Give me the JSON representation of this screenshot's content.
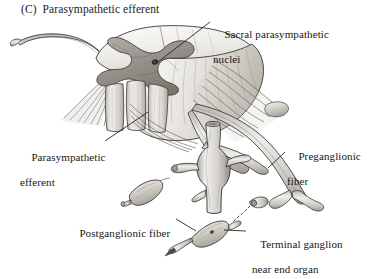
{
  "figure": {
    "panel_letter": "(C)",
    "title": "(C)  Parasympathetic efferent",
    "background_color": "#ffffff",
    "ink_color": "#161616",
    "style": "grayscale anatomical line-and-wash illustration"
  },
  "labels": {
    "sacral_nuclei": {
      "line1": "Sacral parasympathetic",
      "line2": "nuclei"
    },
    "parasympathetic_efferent": {
      "line1": "Parasympathetic",
      "line2": "efferent"
    },
    "preganglionic_fiber": {
      "line1": "Preganglionic",
      "line2": "fiber"
    },
    "postganglionic_fiber": {
      "line1": "Postganglionic fiber"
    },
    "terminal_ganglion": {
      "line1": "Terminal ganglion",
      "line2": "near end organ"
    }
  },
  "structures": [
    {
      "name": "spinal-cord-segment",
      "description": "cut sacral spinal cord block with butterfly gray matter"
    },
    {
      "name": "gray-matter-butterfly",
      "description": "H-shaped gray matter on cut face"
    },
    {
      "name": "white-matter-columns",
      "description": "pale longitudinal columns"
    },
    {
      "name": "dorsal-root-fibers",
      "description": "fanned rootlets left and right"
    },
    {
      "name": "spinal-nerve-trunk-left",
      "description": "curved nerve trunk exiting left"
    },
    {
      "name": "preganglionic-nerve-trunk",
      "description": "long arcing trunk descending to the right"
    },
    {
      "name": "pelvic-vessel",
      "description": "vertical tubular vessel with bulge"
    },
    {
      "name": "detached-ganglion",
      "description": "small isolated spindle ganglion"
    },
    {
      "name": "terminal-ganglion",
      "description": "spindle ganglion near end organ"
    },
    {
      "name": "postganglionic-fiber",
      "description": "short fiber leaving terminal ganglion"
    }
  ]
}
